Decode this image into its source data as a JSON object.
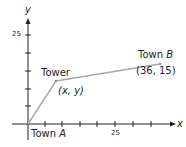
{
  "diagram": {
    "axes": {
      "x_label": "x",
      "y_label": "y",
      "y_tick_label": "25",
      "x_tick_label": "25"
    },
    "points": {
      "town_a": {
        "label_prefix": "Town ",
        "label_var": "A"
      },
      "tower": {
        "label": "Tower",
        "coord": "(x, y)"
      },
      "town_b": {
        "label_prefix": "Town ",
        "label_var": "B",
        "coord": "(36, 15)"
      }
    },
    "colors": {
      "axis": "#222222",
      "path": "#aaaaaa"
    }
  }
}
